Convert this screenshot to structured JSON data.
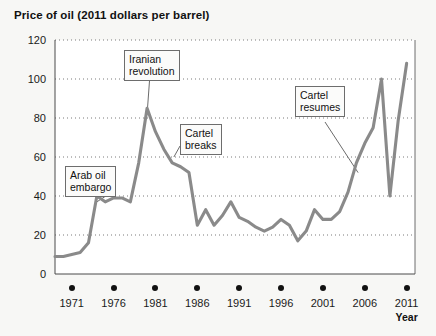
{
  "chart_data": {
    "type": "line",
    "title": "Price of oil (2011 dollars per barrel)",
    "xlabel": "Year",
    "ylabel": "",
    "xlim": [
      1969,
      2012
    ],
    "ylim": [
      0,
      120
    ],
    "grid": true,
    "legend": "none",
    "line_color": "#8a8a8a",
    "xticks": [
      "1971",
      "1976",
      "1981",
      "1986",
      "1991",
      "1996",
      "2001",
      "2006",
      "2011"
    ],
    "xtick_values": [
      1971,
      1976,
      1981,
      1986,
      1991,
      1996,
      2001,
      2006,
      2011
    ],
    "yticks": [
      "0",
      "20",
      "40",
      "60",
      "80",
      "100",
      "120"
    ],
    "ytick_values": [
      0,
      20,
      40,
      60,
      80,
      100,
      120
    ],
    "x": [
      1969,
      1970,
      1971,
      1972,
      1973,
      1974,
      1975,
      1976,
      1977,
      1978,
      1979,
      1980,
      1981,
      1982,
      1983,
      1984,
      1985,
      1986,
      1987,
      1988,
      1989,
      1990,
      1991,
      1992,
      1993,
      1994,
      1995,
      1996,
      1997,
      1998,
      1999,
      2000,
      2001,
      2002,
      2003,
      2004,
      2005,
      2006,
      2007,
      2008,
      2009,
      2010,
      2011
    ],
    "values": [
      9,
      9,
      10,
      11,
      16,
      40,
      37,
      39,
      39,
      37,
      57,
      85,
      73,
      64,
      57,
      55,
      52,
      25,
      33,
      25,
      30,
      37,
      29,
      27,
      24,
      22,
      24,
      28,
      25,
      17,
      22,
      33,
      28,
      28,
      32,
      42,
      57,
      67,
      75,
      100,
      40,
      79,
      108
    ],
    "annotations": [
      {
        "text": "Arab oil\nembargo",
        "target_year": 1974,
        "target_value": 40
      },
      {
        "text": "Iranian\nrevolution",
        "target_year": 1980,
        "target_value": 85
      },
      {
        "text": "Cartel\nbreaks",
        "target_year": 1983,
        "target_value": 57
      },
      {
        "text": "Cartel\nresumes",
        "target_year": 2006,
        "target_value": 67
      }
    ]
  },
  "annotation_labels": {
    "arab_oil_embargo": "Arab oil\nembargo",
    "iranian_revolution": "Iranian\nrevolution",
    "cartel_breaks": "Cartel\nbreaks",
    "cartel_resumes": "Cartel\nresumes"
  }
}
